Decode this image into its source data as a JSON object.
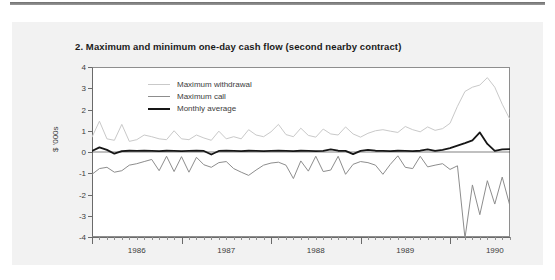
{
  "figure": {
    "title": "2. Maximum and minimum one-day cash flow (second nearby contract)"
  },
  "chart_data": {
    "type": "line",
    "title": "2. Maximum and minimum one-day cash flow (second nearby contract)",
    "xlabel": "",
    "ylabel": "$ '000s",
    "ylim": [
      -4,
      4
    ],
    "yticks": [
      4,
      3,
      2,
      1,
      0,
      -1,
      -2,
      -3,
      -4
    ],
    "ytick_labels": [
      "4",
      "3",
      "2",
      "1",
      "0",
      "-1",
      "-2",
      "-3",
      "-4"
    ],
    "xlim": [
      1986.0,
      1990.67
    ],
    "xtick_labels": [
      "1986",
      "1987",
      "1988",
      "1989",
      "1990"
    ],
    "xtick_values": [
      1986,
      1987,
      1988,
      1989,
      1990
    ],
    "x_minor_interval_months": 1,
    "grid": false,
    "legend_position": "inside-top-left",
    "colors": {
      "maximum_withdrawal": "#c9c9c9",
      "maximum_call": "#8d8d8d",
      "monthly_average": "#161616",
      "axis": "#6a6a6a",
      "panel_background": "#f2f2f2",
      "plot_background": "#ffffff"
    },
    "x": [
      1986.0,
      1986.083,
      1986.167,
      1986.25,
      1986.333,
      1986.417,
      1986.5,
      1986.583,
      1986.667,
      1986.75,
      1986.833,
      1986.917,
      1987.0,
      1987.083,
      1987.167,
      1987.25,
      1987.333,
      1987.417,
      1987.5,
      1987.583,
      1987.667,
      1987.75,
      1987.833,
      1987.917,
      1988.0,
      1988.083,
      1988.167,
      1988.25,
      1988.333,
      1988.417,
      1988.5,
      1988.583,
      1988.667,
      1988.75,
      1988.833,
      1988.917,
      1989.0,
      1989.083,
      1989.167,
      1989.25,
      1989.333,
      1989.417,
      1989.5,
      1989.583,
      1989.667,
      1989.75,
      1989.833,
      1989.917,
      1990.0,
      1990.083,
      1990.167,
      1990.25,
      1990.333,
      1990.417,
      1990.5,
      1990.583,
      1990.667
    ],
    "series": [
      {
        "name": "Maximum withdrawal",
        "color": "#c9c9c9",
        "values": [
          0.7,
          1.45,
          0.62,
          0.55,
          1.3,
          0.5,
          0.58,
          0.8,
          0.72,
          0.62,
          0.58,
          1.0,
          0.62,
          0.58,
          0.8,
          0.66,
          0.55,
          0.98,
          0.62,
          0.72,
          0.62,
          1.05,
          0.8,
          0.72,
          0.95,
          1.3,
          0.82,
          0.72,
          1.12,
          0.78,
          0.7,
          1.08,
          0.85,
          0.8,
          1.18,
          0.85,
          0.7,
          0.88,
          1.0,
          1.05,
          0.98,
          0.92,
          1.2,
          1.05,
          0.95,
          1.18,
          1.02,
          1.1,
          1.35,
          2.15,
          2.85,
          3.05,
          3.15,
          3.5,
          3.05,
          2.25,
          1.55
        ]
      },
      {
        "name": "Maximum call",
        "color": "#8d8d8d",
        "values": [
          -1.05,
          -0.78,
          -0.72,
          -0.95,
          -0.88,
          -0.62,
          -0.55,
          -0.45,
          -0.35,
          -0.88,
          -0.2,
          -0.92,
          -0.22,
          -0.95,
          -0.25,
          -0.6,
          -0.72,
          -0.5,
          -0.45,
          -0.78,
          -0.95,
          -1.1,
          -0.85,
          -0.62,
          -0.52,
          -0.48,
          -0.62,
          -1.25,
          -0.42,
          -0.9,
          -0.2,
          -0.92,
          -0.85,
          -0.2,
          -1.05,
          -0.58,
          -0.45,
          -0.5,
          -0.62,
          -1.05,
          -0.58,
          -0.18,
          -0.72,
          -0.78,
          -0.2,
          -0.7,
          -0.62,
          -0.55,
          -0.82,
          -0.65,
          -4.05,
          -1.55,
          -2.95,
          -1.35,
          -2.45,
          -1.18,
          -2.5
        ]
      },
      {
        "name": "Monthly average",
        "color": "#161616",
        "values": [
          0.05,
          0.22,
          0.1,
          -0.08,
          0.04,
          0.06,
          0.05,
          0.06,
          0.05,
          0.04,
          0.06,
          0.05,
          0.04,
          0.05,
          0.06,
          0.05,
          -0.12,
          0.05,
          0.06,
          0.05,
          0.04,
          0.06,
          0.05,
          0.04,
          0.05,
          0.06,
          0.05,
          0.04,
          0.06,
          0.05,
          0.04,
          0.05,
          0.12,
          0.06,
          0.05,
          -0.1,
          0.05,
          0.1,
          0.06,
          0.05,
          0.04,
          0.06,
          0.05,
          0.04,
          0.06,
          0.12,
          0.05,
          0.1,
          0.18,
          0.3,
          0.42,
          0.55,
          0.92,
          0.38,
          0.05,
          0.12,
          0.14
        ]
      }
    ]
  },
  "legend": {
    "items": [
      {
        "label": "Maximum withdrawal",
        "color": "#c9c9c9"
      },
      {
        "label": "Maximum call",
        "color": "#8d8d8d"
      },
      {
        "label": "Monthly average",
        "color": "#161616"
      }
    ]
  }
}
